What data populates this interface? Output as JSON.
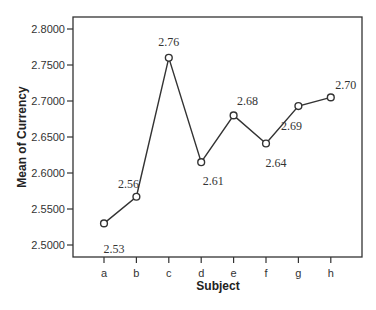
{
  "chart_data": {
    "type": "line",
    "title": "",
    "xlabel": "Subject",
    "ylabel": "Mean of Currency",
    "categories": [
      "a",
      "b",
      "c",
      "d",
      "e",
      "f",
      "g",
      "h"
    ],
    "values": [
      2.53,
      2.567,
      2.76,
      2.615,
      2.68,
      2.641,
      2.693,
      2.705
    ],
    "data_labels": [
      "2.53",
      "2.56",
      "2.76",
      "2.61",
      "2.68",
      "2.64",
      "2.69",
      "2.70"
    ],
    "yticks": [
      "2.5000",
      "2.5500",
      "2.6000",
      "2.6500",
      "2.7000",
      "2.7500",
      "2.8000"
    ],
    "ylim": [
      2.4835,
      2.8165
    ],
    "grid": false,
    "legend": null,
    "marker": "open-circle"
  }
}
